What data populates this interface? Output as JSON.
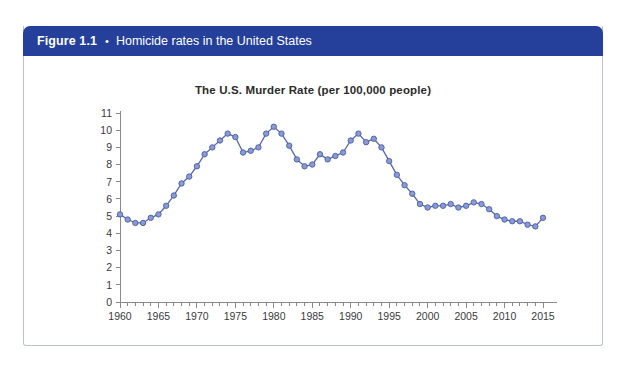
{
  "figure": {
    "number": "Figure 1.1",
    "bullet": "•",
    "caption": "Homicide rates in the United States",
    "header_color": "#25409a",
    "border_color": "#b9c0d8"
  },
  "footnote": {
    "text": ""
  },
  "chart_data": {
    "type": "line",
    "title": "The U.S. Murder Rate (per 100,000 people)",
    "xlabel": "",
    "ylabel": "",
    "xlim": [
      1960,
      2015
    ],
    "ylim": [
      0,
      11
    ],
    "ytick_values": [
      0,
      1,
      2,
      3,
      4,
      5,
      6,
      7,
      8,
      9,
      10,
      11
    ],
    "ytick_labels": [
      "0",
      "1",
      "2",
      "3",
      "4",
      "5",
      "6",
      "7",
      "8",
      "9",
      "10",
      "11"
    ],
    "xtick_labels": [
      "1960",
      "1965",
      "1970",
      "1975",
      "1980",
      "1985",
      "1990",
      "1995",
      "2000",
      "2005",
      "2010",
      "2015"
    ],
    "xtick_major_step": 5,
    "xtick_minor_step": 1,
    "grid": false,
    "legend": null,
    "marker": "circle",
    "line_color": "#5566b5",
    "marker_fill": "#8a9bd4",
    "marker_edge": "#4a5ba8",
    "x": [
      1960,
      1961,
      1962,
      1963,
      1964,
      1965,
      1966,
      1967,
      1968,
      1969,
      1970,
      1971,
      1972,
      1973,
      1974,
      1975,
      1976,
      1977,
      1978,
      1979,
      1980,
      1981,
      1982,
      1983,
      1984,
      1985,
      1986,
      1987,
      1988,
      1989,
      1990,
      1991,
      1992,
      1993,
      1994,
      1995,
      1996,
      1997,
      1998,
      1999,
      2000,
      2001,
      2002,
      2003,
      2004,
      2005,
      2006,
      2007,
      2008,
      2009,
      2010,
      2011,
      2012,
      2013,
      2014,
      2015
    ],
    "values": [
      5.1,
      4.8,
      4.6,
      4.6,
      4.9,
      5.1,
      5.6,
      6.2,
      6.9,
      7.3,
      7.9,
      8.6,
      9.0,
      9.4,
      9.8,
      9.6,
      8.7,
      8.8,
      9.0,
      9.8,
      10.2,
      9.8,
      9.1,
      8.3,
      7.9,
      8.0,
      8.6,
      8.3,
      8.5,
      8.7,
      9.4,
      9.8,
      9.3,
      9.5,
      9.0,
      8.2,
      7.4,
      6.8,
      6.3,
      5.7,
      5.5,
      5.6,
      5.6,
      5.7,
      5.5,
      5.6,
      5.8,
      5.7,
      5.4,
      5.0,
      4.8,
      4.7,
      4.7,
      4.5,
      4.4,
      4.9
    ]
  }
}
